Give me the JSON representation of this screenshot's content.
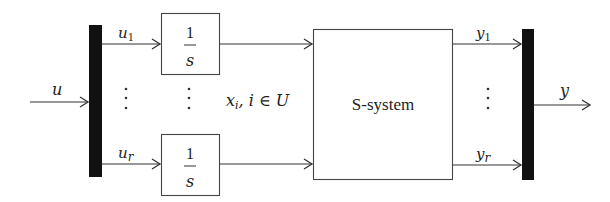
{
  "diagram": {
    "type": "block-diagram",
    "input": {
      "label": "u"
    },
    "demux_bar": {
      "outputs": [
        "u1",
        "ur"
      ]
    },
    "signals_in": [
      {
        "name": "u",
        "sub": "1"
      },
      {
        "name": "u",
        "sub": "r"
      }
    ],
    "integrators": [
      {
        "numerator": "1",
        "denominator": "s"
      },
      {
        "numerator": "1",
        "denominator": "s"
      }
    ],
    "state_label": {
      "var": "x",
      "sub": "i",
      "rest": ", i ∈ U"
    },
    "system_block": {
      "label": "S-system"
    },
    "signals_out": [
      {
        "name": "y",
        "sub": "1"
      },
      {
        "name": "y",
        "sub": "r"
      }
    ],
    "mux_bar": {},
    "output": {
      "label": "y"
    },
    "ellipsis": "⋮"
  }
}
